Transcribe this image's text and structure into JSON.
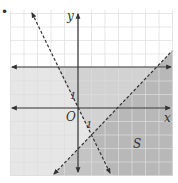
{
  "diagram": {
    "type": "coordinate-plane-linear-inequalities",
    "bullet": "•",
    "axes": {
      "x_label": "x",
      "y_label": "y",
      "origin_label": "O",
      "x_tick_label": "1",
      "y_tick_label": "1"
    },
    "region_label": "S",
    "lines": [
      {
        "name": "horizontal-upper",
        "style": "solid",
        "equation": "y = 3"
      },
      {
        "name": "x-axis-boundary",
        "style": "solid",
        "equation": "y = 0"
      },
      {
        "name": "steep-dashed",
        "style": "dashed",
        "equation": "y = -2x"
      },
      {
        "name": "diagonal-dashed",
        "style": "dashed",
        "equation": "y = x - 3"
      }
    ],
    "colors": {
      "grid": "#d8d8d8",
      "line": "#333333",
      "shade_light": "#e6e6e6",
      "shade_medium": "#cfcfcf",
      "shade_dark": "#b5b5b5",
      "background": "#ffffff"
    }
  }
}
